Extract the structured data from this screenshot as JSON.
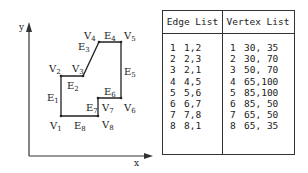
{
  "diagram": {
    "axes": {
      "x_label": "x",
      "y_label": "y"
    },
    "vertices": [
      {
        "name": "V",
        "sub": "1"
      },
      {
        "name": "V",
        "sub": "2"
      },
      {
        "name": "V",
        "sub": "3"
      },
      {
        "name": "V",
        "sub": "4"
      },
      {
        "name": "V",
        "sub": "5"
      },
      {
        "name": "V",
        "sub": "6"
      },
      {
        "name": "V",
        "sub": "7"
      },
      {
        "name": "V",
        "sub": "8"
      }
    ],
    "edges": [
      {
        "name": "E",
        "sub": "1"
      },
      {
        "name": "E",
        "sub": "2"
      },
      {
        "name": "E",
        "sub": "3"
      },
      {
        "name": "E",
        "sub": "4"
      },
      {
        "name": "E",
        "sub": "5"
      },
      {
        "name": "E",
        "sub": "6"
      },
      {
        "name": "E",
        "sub": "7"
      },
      {
        "name": "E",
        "sub": "8"
      }
    ]
  },
  "table": {
    "edge_header": "Edge List",
    "vertex_header": "Vertex List",
    "edge_rows": [
      {
        "id": "1",
        "value": "1,2"
      },
      {
        "id": "2",
        "value": "2,3"
      },
      {
        "id": "3",
        "value": "2,1"
      },
      {
        "id": "4",
        "value": "4,5"
      },
      {
        "id": "5",
        "value": "5,6"
      },
      {
        "id": "6",
        "value": "6,7"
      },
      {
        "id": "7",
        "value": "7,8"
      },
      {
        "id": "8",
        "value": "8,1"
      }
    ],
    "vertex_rows": [
      {
        "id": "1",
        "value": "30, 35"
      },
      {
        "id": "2",
        "value": "30, 70"
      },
      {
        "id": "3",
        "value": "50, 70"
      },
      {
        "id": "4",
        "value": "65,100"
      },
      {
        "id": "5",
        "value": "85,100"
      },
      {
        "id": "6",
        "value": "85, 50"
      },
      {
        "id": "7",
        "value": "65, 50"
      },
      {
        "id": "8",
        "value": "65, 35"
      }
    ]
  }
}
